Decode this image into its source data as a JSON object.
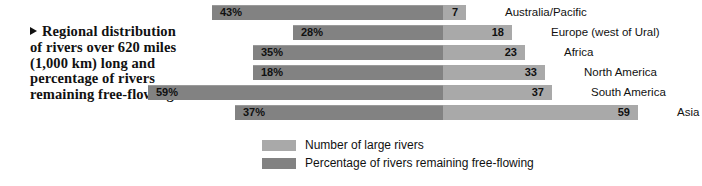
{
  "caption": {
    "marker": "triangle-bullet",
    "text": "Regional distribution of rivers over 620 miles (1,000 km) long and percentage of rivers remaining free-flowing."
  },
  "legend": {
    "position": "bottom-center",
    "items": [
      {
        "label": "Number of large rivers",
        "color": "#a9a9a9",
        "swatch": "light-gray-swatch"
      },
      {
        "label": "Percentage of rivers remaining free-flowing",
        "color": "#828282",
        "swatch": "dark-gray-swatch"
      }
    ]
  },
  "chart_data": {
    "type": "bar",
    "orientation": "horizontal-diverging",
    "title": "Regional distribution of rivers over 620 miles (1,000 km) long and percentage of rivers remaining free-flowing.",
    "xlabel": "",
    "ylabel": "",
    "grid": false,
    "categories": [
      "Australia/Pacific",
      "Europe (west of Ural)",
      "Africa",
      "North America",
      "South America",
      "Asia"
    ],
    "series": [
      {
        "name": "Percentage of rivers remaining free-flowing",
        "unit": "%",
        "direction": "left",
        "color": "#828282",
        "values": [
          43,
          28,
          35,
          18,
          59,
          37
        ],
        "labels": [
          "43%",
          "28%",
          "35%",
          "18%",
          "59%",
          "37%"
        ]
      },
      {
        "name": "Number of large rivers",
        "unit": "count",
        "direction": "right",
        "color": "#a9a9a9",
        "values": [
          7,
          18,
          23,
          33,
          37,
          59
        ],
        "labels": [
          "7",
          "18",
          "23",
          "33",
          "37",
          "59"
        ]
      }
    ],
    "rows": [
      {
        "region": "Australia/Pacific",
        "percent": 43,
        "percent_label": "43%",
        "count": 7,
        "count_label": "7"
      },
      {
        "region": "Europe (west of Ural)",
        "percent": 28,
        "percent_label": "28%",
        "count": 18,
        "count_label": "18"
      },
      {
        "region": "Africa",
        "percent": 35,
        "percent_label": "35%",
        "count": 23,
        "count_label": "23"
      },
      {
        "region": "North America",
        "percent": 18,
        "percent_label": "18%",
        "count": 33,
        "count_label": "33"
      },
      {
        "region": "South America",
        "percent": 59,
        "percent_label": "59%",
        "count": 37,
        "count_label": "37"
      },
      {
        "region": "Asia",
        "percent": 37,
        "percent_label": "37%",
        "count": 59,
        "count_label": "59"
      }
    ]
  },
  "layout": {
    "divider_x": 443,
    "row_top_start": 5,
    "row_pitch": 20,
    "bar_height": 15,
    "pct_left_extents": [
      212,
      293,
      253,
      253,
      148,
      235
    ],
    "count_right_extents": [
      466,
      512,
      525,
      545,
      552,
      638
    ],
    "region_label_x": [
      505,
      551,
      564,
      584,
      591,
      677
    ]
  }
}
